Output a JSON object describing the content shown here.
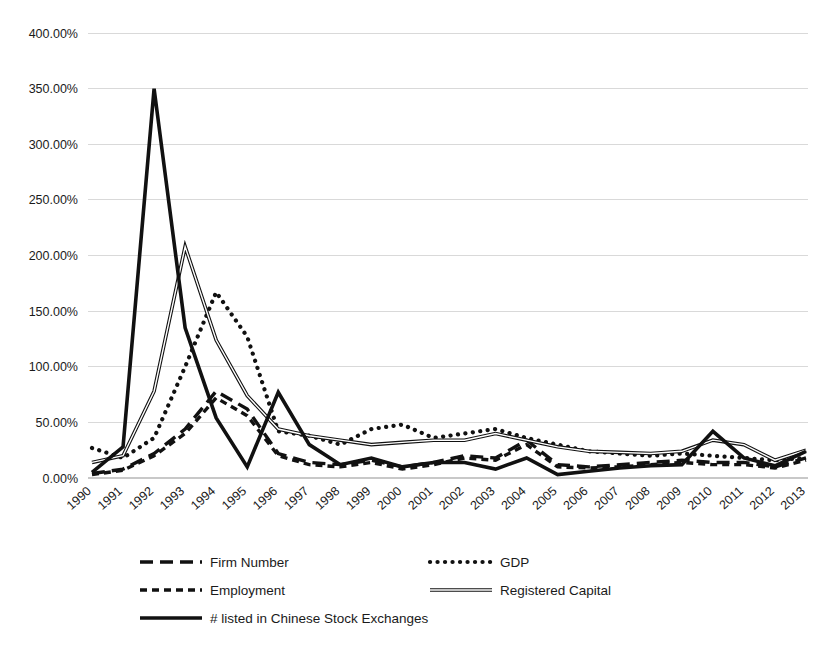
{
  "chart_data": {
    "type": "line",
    "title": "",
    "xlabel": "",
    "ylabel": "",
    "ylim": [
      0,
      400
    ],
    "grid": true,
    "legend_position": "bottom",
    "categories": [
      "1990",
      "1991",
      "1992",
      "1993",
      "1994",
      "1995",
      "1996",
      "1997",
      "1998",
      "1999",
      "2000",
      "2001",
      "2002",
      "2003",
      "2004",
      "2005",
      "2006",
      "2007",
      "2008",
      "2009",
      "2010",
      "2011",
      "2012",
      "2013"
    ],
    "y_tick_labels": [
      "0.00%",
      "50.00%",
      "100.00%",
      "150.00%",
      "200.00%",
      "250.00%",
      "300.00%",
      "350.00%",
      "400.00%"
    ],
    "y_tick_values": [
      0,
      50,
      100,
      150,
      200,
      250,
      300,
      350,
      400
    ],
    "series": [
      {
        "name": "Firm Number",
        "style": "long-dash",
        "values": [
          4,
          8,
          22,
          44,
          78,
          62,
          22,
          14,
          12,
          16,
          10,
          14,
          20,
          18,
          34,
          12,
          10,
          12,
          14,
          16,
          14,
          14,
          10,
          18
        ]
      },
      {
        "name": "GDP",
        "style": "dotted",
        "values": [
          27,
          18,
          36,
          100,
          167,
          127,
          42,
          38,
          30,
          44,
          48,
          36,
          40,
          44,
          36,
          30,
          24,
          22,
          20,
          22,
          20,
          18,
          16,
          18
        ]
      },
      {
        "name": "Employment",
        "style": "short-dash",
        "values": [
          3,
          7,
          20,
          40,
          72,
          56,
          20,
          12,
          10,
          14,
          8,
          12,
          18,
          16,
          30,
          10,
          9,
          10,
          12,
          14,
          12,
          12,
          9,
          16
        ]
      },
      {
        "name": "Registered Capital",
        "style": "thin-solid-outline",
        "values": [
          14,
          20,
          78,
          208,
          124,
          74,
          44,
          38,
          34,
          30,
          32,
          34,
          34,
          40,
          34,
          28,
          24,
          23,
          22,
          24,
          34,
          30,
          16,
          25
        ]
      },
      {
        "name": "# listed in Chinese Stock Exchanges",
        "style": "thick-solid",
        "values": [
          5,
          28,
          350,
          135,
          54,
          10,
          77,
          30,
          12,
          18,
          10,
          14,
          14,
          8,
          18,
          3,
          6,
          9,
          11,
          12,
          42,
          18,
          11,
          24
        ]
      }
    ],
    "legend": [
      {
        "label": "Firm Number",
        "style": "long-dash"
      },
      {
        "label": "GDP",
        "style": "dotted"
      },
      {
        "label": "Employment",
        "style": "short-dash"
      },
      {
        "label": "Registered Capital",
        "style": "thin-solid-outline"
      },
      {
        "label": "# listed in Chinese Stock Exchanges",
        "style": "thick-solid"
      }
    ]
  }
}
